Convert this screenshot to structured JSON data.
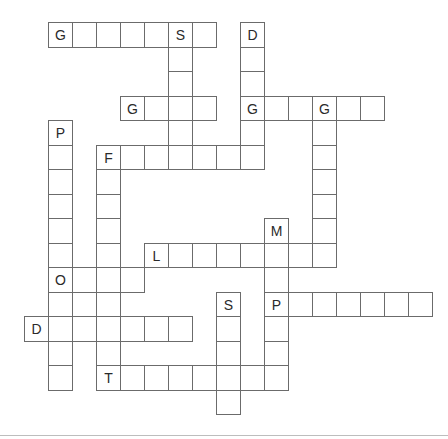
{
  "puzzle": {
    "type": "crossword",
    "cell_size": 24,
    "row_height": 24.5,
    "origin": {
      "x": 0,
      "y": 22
    },
    "colors": {
      "border": "#6b6b6b",
      "text": "#2a2a2a",
      "background": "#ffffff",
      "footer_line": "#bdbdbd"
    },
    "words": [
      {
        "id": "across-1",
        "direction": "across",
        "row": 0,
        "col": 2,
        "length": 7,
        "given": {
          "0": "G",
          "5": "S"
        }
      },
      {
        "id": "down-1",
        "direction": "down",
        "row": 0,
        "col": 7,
        "length": 6,
        "given": {
          "0": "S"
        }
      },
      {
        "id": "down-2",
        "direction": "down",
        "row": 0,
        "col": 10,
        "length": 6,
        "given": {
          "0": "D",
          "3": "G"
        }
      },
      {
        "id": "across-2",
        "direction": "across",
        "row": 3,
        "col": 5,
        "length": 4,
        "given": {
          "0": "G"
        }
      },
      {
        "id": "across-3",
        "direction": "across",
        "row": 3,
        "col": 10,
        "length": 6,
        "given": {
          "0": "G",
          "3": "G"
        }
      },
      {
        "id": "down-3",
        "direction": "down",
        "row": 3,
        "col": 13,
        "length": 7,
        "given": {
          "0": "G"
        }
      },
      {
        "id": "down-4",
        "direction": "down",
        "row": 4,
        "col": 2,
        "length": 11,
        "given": {
          "0": "P",
          "6": "O"
        }
      },
      {
        "id": "across-4",
        "direction": "across",
        "row": 5,
        "col": 4,
        "length": 7,
        "given": {
          "0": "F"
        }
      },
      {
        "id": "down-5",
        "direction": "down",
        "row": 5,
        "col": 4,
        "length": 10,
        "given": {
          "0": "F",
          "9": "T"
        }
      },
      {
        "id": "down-6",
        "direction": "down",
        "row": 8,
        "col": 11,
        "length": 7,
        "given": {
          "0": "M",
          "3": "P"
        }
      },
      {
        "id": "across-5",
        "direction": "across",
        "row": 9,
        "col": 6,
        "length": 8,
        "given": {
          "0": "L"
        }
      },
      {
        "id": "across-6",
        "direction": "across",
        "row": 10,
        "col": 2,
        "length": 4,
        "given": {
          "0": "O"
        }
      },
      {
        "id": "across-7",
        "direction": "across",
        "row": 11,
        "col": 11,
        "length": 7,
        "given": {
          "0": "P"
        }
      },
      {
        "id": "down-7",
        "direction": "down",
        "row": 11,
        "col": 9,
        "length": 5,
        "given": {
          "0": "S"
        }
      },
      {
        "id": "across-8",
        "direction": "across",
        "row": 12,
        "col": 1,
        "length": 7,
        "given": {
          "0": "D"
        }
      },
      {
        "id": "across-9",
        "direction": "across",
        "row": 14,
        "col": 4,
        "length": 8,
        "given": {
          "0": "T"
        }
      }
    ]
  }
}
